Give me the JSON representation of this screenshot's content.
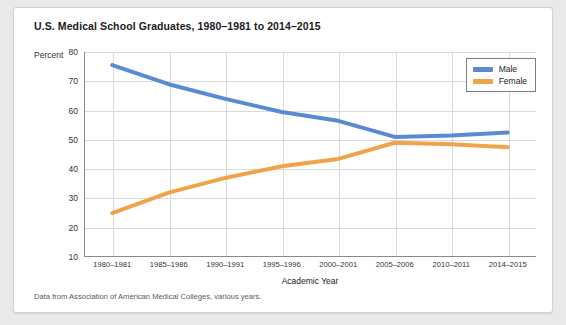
{
  "card": {
    "title": "U.S. Medical School Graduates, 1980–1981 to 2014–2015",
    "percent_axis_label": "Percent",
    "source_note": "Data from Association of American Medical Colleges, various years."
  },
  "colors": {
    "male": "#5b8ad4",
    "female": "#f0a34a",
    "grid": "#dadada",
    "axis": "#8a8a8a",
    "card_bg": "#ffffff",
    "page_bg": "#e9e9e7",
    "text": "#222222"
  },
  "chart_data": {
    "type": "line",
    "title": "U.S. Medical School Graduates, 1980–1981 to 2014–2015",
    "xlabel": "Academic Year",
    "ylabel": "Percent",
    "ylim": [
      10,
      80
    ],
    "yticks": [
      10,
      20,
      30,
      40,
      50,
      60,
      70,
      80
    ],
    "grid": true,
    "legend_position": "top-right",
    "categories": [
      "1980–1981",
      "1985–1986",
      "1990–1991",
      "1995–1996",
      "2000–2001",
      "2005–2006",
      "2010–2011",
      "2014–2015"
    ],
    "series": [
      {
        "name": "Male",
        "color": "#5b8ad4",
        "values": [
          75.5,
          69,
          64,
          59.5,
          56.5,
          51,
          51.5,
          52.5
        ]
      },
      {
        "name": "Female",
        "color": "#f0a34a",
        "values": [
          25,
          32,
          37,
          41,
          43.5,
          49,
          48.5,
          47.5
        ]
      }
    ]
  }
}
